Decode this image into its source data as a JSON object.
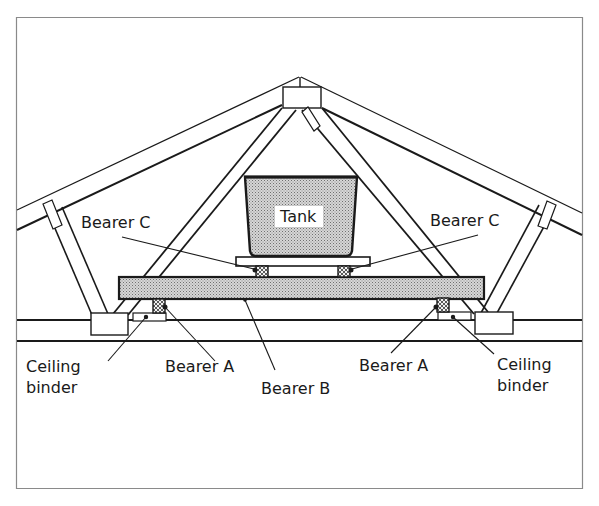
{
  "diagram": {
    "labels": {
      "tank": "Tank",
      "bearer_c_left": "Bearer C",
      "bearer_c_right": "Bearer C",
      "ceiling_binder_left_1": "Ceiling",
      "ceiling_binder_left_2": "binder",
      "bearer_a_left": "Bearer A",
      "bearer_b": "Bearer B",
      "bearer_a_right": "Bearer A",
      "ceiling_binder_right_1": "Ceiling",
      "ceiling_binder_right_2": "binder"
    },
    "colors": {
      "line": "#1a1a1a",
      "hatch_fill": "#c8c8c8",
      "frame": "#8a8a8a",
      "background": "#ffffff"
    }
  }
}
